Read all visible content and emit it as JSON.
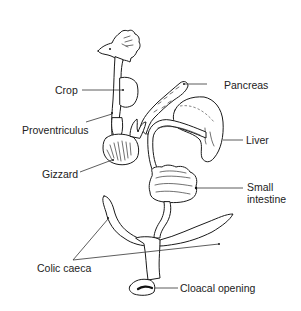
{
  "figure": {
    "background": "#ffffff",
    "line_color": "#1a1a1a"
  },
  "labels": {
    "crop": "Crop",
    "proventriculus": "Proventriculus",
    "gizzard": "Gizzard",
    "pancreas": "Pancreas",
    "liver": "Liver",
    "small_intestine_line1": "Small",
    "small_intestine_line2": "intestine",
    "colic_caeca": "Colic caeca",
    "cloacal_opening": "Cloacal opening"
  }
}
